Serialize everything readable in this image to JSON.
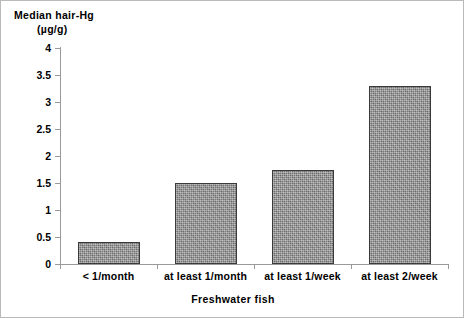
{
  "chart_data": {
    "type": "bar",
    "title": "",
    "ylabel": "Median hair-Hg (µg/g)",
    "ylabel_line1": "Median hair-Hg",
    "ylabel_line2": "(µg/g)",
    "xlabel": "Freshwater fish",
    "categories": [
      "< 1/month",
      "at least 1/month",
      "at least 1/week",
      "at least 2/week"
    ],
    "values": [
      0.4,
      1.5,
      1.75,
      3.3
    ],
    "ylim": [
      0,
      4
    ],
    "yticks": [
      0,
      0.5,
      1,
      1.5,
      2,
      2.5,
      3,
      3.5,
      4
    ],
    "ytick_labels": [
      "0",
      "0.5",
      "1",
      "1.5",
      "2",
      "2.5",
      "3",
      "3.5",
      "4"
    ],
    "grid": false,
    "legend": false,
    "bar_fill_color": "#909090",
    "bar_edge_color": "#3a3a3a",
    "axis_color": "#9a9a9a",
    "text_color": "#000000",
    "background_color": "#ffffff"
  }
}
